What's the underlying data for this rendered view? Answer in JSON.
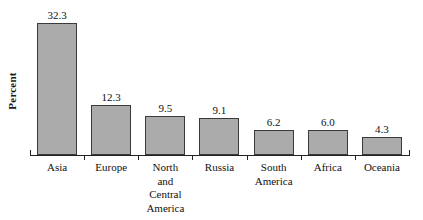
{
  "chart_data": {
    "type": "bar",
    "title": "",
    "xlabel": "",
    "ylabel": "Percent",
    "ylim": [
      0,
      36
    ],
    "grid": false,
    "legend": "none",
    "categories": [
      "Asia",
      "Europe",
      "North and Central America",
      "Russia",
      "South America",
      "Africa",
      "Oceania"
    ],
    "category_lines": [
      [
        "Asia"
      ],
      [
        "Europe"
      ],
      [
        "North",
        "and",
        "Central",
        "America"
      ],
      [
        "Russia"
      ],
      [
        "South",
        "America"
      ],
      [
        "Africa"
      ],
      [
        "Oceania"
      ]
    ],
    "values": [
      32.3,
      12.3,
      9.5,
      9.1,
      6.2,
      6.0,
      4.3
    ],
    "value_labels": [
      "32.3",
      "12.3",
      "9.5",
      "9.1",
      "6.2",
      "6.0",
      "4.3"
    ],
    "bar_fill": "#ababab",
    "bar_border": "#3a3a3a",
    "axis_color": "#222222",
    "text_color": "#111111",
    "background": "#ffffff"
  }
}
